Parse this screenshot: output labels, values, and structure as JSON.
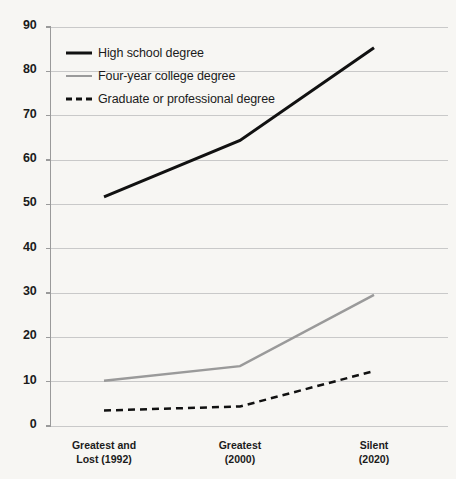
{
  "chart_data": {
    "type": "line",
    "title": "",
    "subtitle": "",
    "xlabel": "",
    "ylabel": "",
    "grid": true,
    "legend_position": "top-left-inside",
    "ylim": [
      0,
      90
    ],
    "yticks": [
      0,
      10,
      20,
      30,
      40,
      50,
      60,
      70,
      80,
      90
    ],
    "ytick_labels": [
      "0",
      "10",
      "20",
      "30",
      "40",
      "50",
      "60",
      "70",
      "80",
      "90"
    ],
    "categories": [
      "Greatest and Lost (1992)",
      "Greatest (2000)",
      "Silent (2020)"
    ],
    "category_lines": [
      [
        "Greatest and",
        "Lost (1992)"
      ],
      [
        "Greatest",
        "(2000)"
      ],
      [
        "Silent",
        "(2020)"
      ]
    ],
    "series": [
      {
        "name": "High school degree",
        "style": "solid",
        "color": "#111111",
        "width": 3,
        "values": [
          51.7,
          64.4,
          85.3
        ]
      },
      {
        "name": "Four-year college degree",
        "style": "solid",
        "color": "#9a9a9a",
        "width": 2.5,
        "values": [
          10.2,
          13.5,
          29.6
        ]
      },
      {
        "name": "Graduate or professional degree",
        "style": "dashed",
        "color": "#111111",
        "width": 2.5,
        "values": [
          3.5,
          4.4,
          12.4
        ]
      }
    ]
  },
  "colors": {
    "background": "#f7f6f3",
    "grid": "#c9c9c9",
    "axis": "#9a9a9a",
    "text": "#1b1b1b"
  }
}
